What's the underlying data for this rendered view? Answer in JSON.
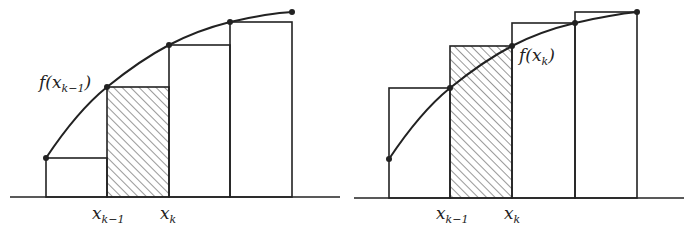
{
  "figure": {
    "colors": {
      "stroke": "#222222",
      "background": "#ffffff",
      "hatch": "#333333"
    },
    "panels": [
      {
        "id": "left-sum",
        "curve_label": {
          "base": "f(x",
          "sub": "k−1",
          "close": ")"
        },
        "axis_labels": [
          {
            "base": "x",
            "sub": "k−1"
          },
          {
            "base": "x",
            "sub": "k"
          }
        ]
      },
      {
        "id": "right-sum",
        "curve_label": {
          "base": "f(x",
          "sub": "k",
          "close": ")"
        },
        "axis_labels": [
          {
            "base": "x",
            "sub": "k−1"
          },
          {
            "base": "x",
            "sub": "k"
          }
        ]
      }
    ]
  }
}
